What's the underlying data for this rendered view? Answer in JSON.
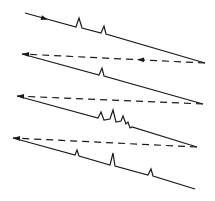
{
  "diagram": {
    "title": "",
    "type": "raster-scan-lines",
    "stroke_color": "#1a1a1a",
    "background": "#ffffff",
    "scan_lines": [
      {
        "name": "trace-1",
        "style": "solid",
        "path": "M25,13 L76,27 L79,18 L82,28 L101,33 L104,26 L106,34 L205,63",
        "arrow": {
          "x": 48,
          "y": 19.5,
          "angle": 15.5
        }
      },
      {
        "name": "retrace-1",
        "style": "dashed",
        "path": "M205,63 L22,54",
        "arrow": {
          "x": 137,
          "y": 59.6,
          "angle": 182.8
        },
        "end_arrow": {
          "x": 22,
          "y": 54,
          "angle": 182.8
        }
      },
      {
        "name": "trace-2",
        "style": "solid",
        "path": "M22,54 L99,75 L102,68 L104,76 L203,104",
        "arrow": null
      },
      {
        "name": "retrace-2",
        "style": "dashed",
        "path": "M203,104 L17,96",
        "arrow": null,
        "end_arrow": {
          "x": 17,
          "y": 96,
          "angle": 182.5
        }
      },
      {
        "name": "trace-3",
        "style": "solid",
        "path": "M17,96 L98,118 L101,112 L104,120 L110,119 L113,110 L116,122 L121,121 L123,116 L126,124 L128,122 L130,128 L132,127 L197,147",
        "arrow": null
      },
      {
        "name": "retrace-3",
        "style": "dashed",
        "path": "M197,147 L13,138",
        "arrow": null,
        "end_arrow": {
          "x": 13,
          "y": 138,
          "angle": 182.8
        }
      },
      {
        "name": "trace-4",
        "style": "solid",
        "path": "M13,138 L75,155 L77,150 L79,156 L110,165 L113,153 L115,166 L148,175 L151,169 L153,176 L195,189",
        "arrow": null
      }
    ]
  }
}
